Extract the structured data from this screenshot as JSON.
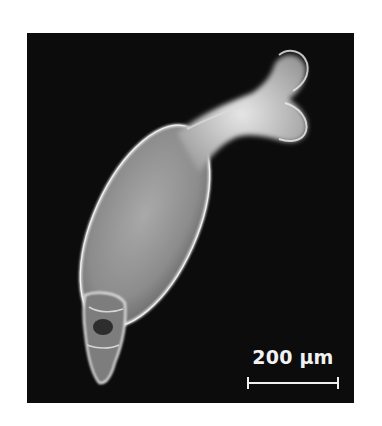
{
  "figure": {
    "background_color": "#0c0c0c",
    "specimen_color": "#cfcfcf",
    "scale_bar": {
      "label": "200 µm",
      "value": 200,
      "unit": "µm",
      "color": "#f0f0f0"
    }
  }
}
